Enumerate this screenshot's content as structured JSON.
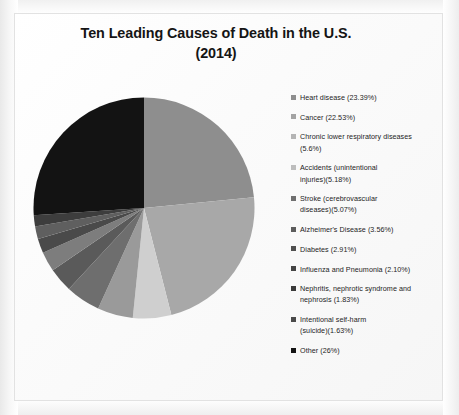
{
  "slide": {
    "title_line_1": "Ten Leading Causes of Death in the U.S.",
    "title_line_2": "(2014)"
  },
  "chart_data": {
    "type": "pie",
    "title": "Ten Leading Causes of Death in the U.S. (2014)",
    "subtitle": "",
    "xlabel": "",
    "ylabel": "",
    "legend_position": "right",
    "grid": false,
    "start_angle_oclock": 12,
    "direction": "clockwise",
    "units": "percent",
    "categories": [
      "Heart disease",
      "Cancer",
      "Chronic lower respiratory diseases",
      "Accidents (unintentional injuries)",
      "Stroke (cerebrovascular diseases)",
      "Alzheimer's Disease",
      "Diabetes",
      "Influenza and Pneumonia",
      "Nephritis, nephrotic syndrome and nephrosis",
      "Intentional self-harm (suicide)",
      "Other"
    ],
    "values": [
      23.39,
      22.53,
      5.6,
      5.18,
      5.07,
      3.56,
      2.91,
      2.1,
      1.83,
      1.63,
      26
    ],
    "colors": [
      "#8e8e8e",
      "#a8a8a8",
      "#cfcfcf",
      "#9a9a9a",
      "#6e6e6e",
      "#5a5a5a",
      "#7d7d7d",
      "#4a4a4a",
      "#5f5f5f",
      "#3d3d3d",
      "#131313"
    ],
    "legend": [
      {
        "label": "Heart disease (23.39%)",
        "swatch": "#8e8e8e"
      },
      {
        "label": "Cancer (22.53%)",
        "swatch": "#a3a3a3"
      },
      {
        "label": "Chronic lower respiratory diseases\n(5.6%)",
        "swatch": "#b4b4b4"
      },
      {
        "label": "Accidents (unintentional\ninjuries)(5.18%)",
        "swatch": "#bdbdbd"
      },
      {
        "label": "Stroke (cerebrovascular\ndiseases)(5.07%)",
        "swatch": "#6f6f6f"
      },
      {
        "label": "Alzheimer's Disease (3.56%)",
        "swatch": "#5c5c5c"
      },
      {
        "label": "Diabetes (2.91%)",
        "swatch": "#4f4f4f"
      },
      {
        "label": "Influenza and Pneumonia (2.10%)",
        "swatch": "#444444"
      },
      {
        "label": "Nephritis, nephrotic syndrome and\nnephrosis (1.83%)",
        "swatch": "#3a3a3a"
      },
      {
        "label": "Intentional self-harm\n(suicide)(1.63%)",
        "swatch": "#4a4a4a"
      },
      {
        "label": "Other (26%)",
        "swatch": "#141414"
      }
    ]
  }
}
